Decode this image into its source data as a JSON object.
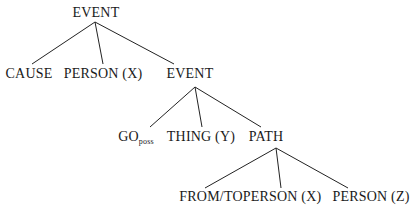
{
  "diagram": {
    "type": "tree",
    "nodes": [
      {
        "id": "n0",
        "label": "EVENT",
        "x": 96,
        "y": 6
      },
      {
        "id": "n1",
        "label": "CAUSE",
        "x": 29,
        "y": 67
      },
      {
        "id": "n2",
        "label": "PERSON (X)",
        "x": 103,
        "y": 67
      },
      {
        "id": "n3",
        "label": "EVENT",
        "x": 190,
        "y": 67
      },
      {
        "id": "n4",
        "label": "GO",
        "sub": "poss",
        "x": 134,
        "y": 130
      },
      {
        "id": "n5",
        "label": "THING (Y)",
        "x": 201,
        "y": 130
      },
      {
        "id": "n6",
        "label": "PATH",
        "x": 266,
        "y": 130
      },
      {
        "id": "n7",
        "label": "FROM/TO",
        "x": 211,
        "y": 190
      },
      {
        "id": "n8",
        "label": "PERSON (X)",
        "x": 282,
        "y": 190
      },
      {
        "id": "n9",
        "label": "PERSON (Z)",
        "x": 371,
        "y": 190
      }
    ],
    "edges": [
      [
        "n0",
        "n1"
      ],
      [
        "n0",
        "n2"
      ],
      [
        "n0",
        "n3"
      ],
      [
        "n3",
        "n4"
      ],
      [
        "n3",
        "n5"
      ],
      [
        "n3",
        "n6"
      ],
      [
        "n6",
        "n7"
      ],
      [
        "n6",
        "n8"
      ],
      [
        "n6",
        "n9"
      ]
    ]
  }
}
